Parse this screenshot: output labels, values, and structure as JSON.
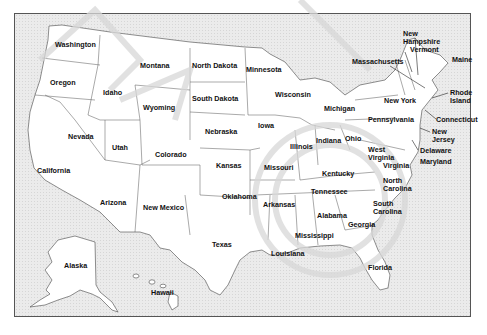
{
  "map": {
    "title": "United States Map",
    "colors": {
      "background": "#ebebeb",
      "state_fill": "#ffffff",
      "border": "#444444",
      "label": "#111111",
      "watermark": "#d0d0d0"
    },
    "states": [
      {
        "name": "Washington",
        "label": "Washington",
        "x": 55,
        "y": 45
      },
      {
        "name": "Oregon",
        "label": "Oregon",
        "x": 48,
        "y": 79
      },
      {
        "name": "Idaho",
        "label": "Idaho",
        "x": 104,
        "y": 90
      },
      {
        "name": "Montana",
        "label": "Montana",
        "x": 140,
        "y": 63
      },
      {
        "name": "North Dakota",
        "label": "North Dakota",
        "x": 192,
        "y": 63
      },
      {
        "name": "Minnesota",
        "label": "Minnesota",
        "x": 246,
        "y": 67
      },
      {
        "name": "South Dakota",
        "label": "South Dakota",
        "x": 192,
        "y": 96
      },
      {
        "name": "Wyoming",
        "label": "Wyoming",
        "x": 143,
        "y": 105
      },
      {
        "name": "Wisconsin",
        "label": "Wisconsin",
        "x": 276,
        "y": 92
      },
      {
        "name": "Michigan",
        "label": "Michigan",
        "x": 324,
        "y": 106
      },
      {
        "name": "New York",
        "label": "New York",
        "x": 384,
        "y": 98
      },
      {
        "name": "Nevada",
        "label": "Nevada",
        "x": 68,
        "y": 133
      },
      {
        "name": "Utah",
        "label": "Utah",
        "x": 112,
        "y": 144
      },
      {
        "name": "Colorado",
        "label": "Colorado",
        "x": 155,
        "y": 150
      },
      {
        "name": "Nebraska",
        "label": "Nebraska",
        "x": 205,
        "y": 128
      },
      {
        "name": "Iowa",
        "label": "Iowa",
        "x": 260,
        "y": 122
      },
      {
        "name": "Illinois",
        "label": "Illinois",
        "x": 290,
        "y": 145
      },
      {
        "name": "Indiana",
        "label": "Indiana",
        "x": 318,
        "y": 138
      },
      {
        "name": "Ohio",
        "label": "Ohio",
        "x": 344,
        "y": 136
      },
      {
        "name": "Pennsylvania",
        "label": "Pennsylvania",
        "x": 368,
        "y": 118
      },
      {
        "name": "Kansas",
        "label": "Kansas",
        "x": 217,
        "y": 162
      },
      {
        "name": "Missouri",
        "label": "Missouri",
        "x": 264,
        "y": 165
      },
      {
        "name": "Kentucky",
        "label": "Kentucky",
        "x": 323,
        "y": 170
      },
      {
        "name": "West Virginia",
        "label": "West Virginia",
        "x": 368,
        "y": 147
      },
      {
        "name": "Virginia",
        "label": "Virginia",
        "x": 384,
        "y": 162
      },
      {
        "name": "California",
        "label": "California",
        "x": 37,
        "y": 168
      },
      {
        "name": "Arizona",
        "label": "Arizona",
        "x": 100,
        "y": 200
      },
      {
        "name": "New Mexico",
        "label": "New Mexico",
        "x": 143,
        "y": 205
      },
      {
        "name": "Oklahoma",
        "label": "Oklahoma",
        "x": 222,
        "y": 193
      },
      {
        "name": "Arkansas",
        "label": "Arkansas",
        "x": 264,
        "y": 202
      },
      {
        "name": "Tennessee",
        "label": "Tennessee",
        "x": 311,
        "y": 190
      },
      {
        "name": "North Carolina",
        "label": "North Carolina",
        "x": 382,
        "y": 179
      },
      {
        "name": "South Carolina",
        "label": "South Carolina",
        "x": 373,
        "y": 202
      },
      {
        "name": "Alabama",
        "label": "Alabama",
        "x": 317,
        "y": 213
      },
      {
        "name": "Georgia",
        "label": "Georgia",
        "x": 348,
        "y": 222
      },
      {
        "name": "Mississippi",
        "label": "Mississippi",
        "x": 295,
        "y": 234
      },
      {
        "name": "Louisiana",
        "label": "Louisiana",
        "x": 271,
        "y": 250
      },
      {
        "name": "Texas",
        "label": "Texas",
        "x": 212,
        "y": 242
      },
      {
        "name": "Florida",
        "label": "Florida",
        "x": 368,
        "y": 265
      },
      {
        "name": "Alaska",
        "label": "Alaska",
        "x": 64,
        "y": 262
      },
      {
        "name": "Hawaii",
        "label": "Hawaii",
        "x": 151,
        "y": 289
      },
      {
        "name": "New Hampshire",
        "label": "New Hampshire",
        "x": 403,
        "y": 30
      },
      {
        "name": "Vermont",
        "label": "Vermont",
        "x": 410,
        "y": 47
      },
      {
        "name": "Massachusetts",
        "label": "Massachusetts",
        "x": 352,
        "y": 58
      },
      {
        "name": "Maine",
        "label": "Maine",
        "x": 453,
        "y": 57
      },
      {
        "name": "Rhode Island",
        "label": "Rhode Island",
        "x": 451,
        "y": 89
      },
      {
        "name": "Connecticut",
        "label": "Connecticut",
        "x": 437,
        "y": 117
      },
      {
        "name": "New Jersey",
        "label": "New Jersey",
        "x": 432,
        "y": 128
      },
      {
        "name": "Delaware",
        "label": "Delaware",
        "x": 420,
        "y": 147
      },
      {
        "name": "Maryland",
        "label": "Maryland",
        "x": 420,
        "y": 158
      }
    ]
  }
}
